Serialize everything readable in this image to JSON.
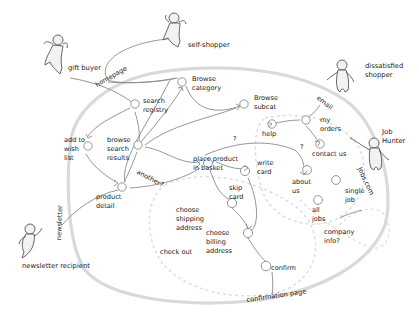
{
  "diagram": {
    "type": "user-journey site map (hand-drawn)",
    "personas": [
      {
        "id": "gift-buyer",
        "label": "gift buyer"
      },
      {
        "id": "self-shopper",
        "label": "self-shopper"
      },
      {
        "id": "dissatisfied-shopper",
        "label": "dissatisfied\nshopper"
      },
      {
        "id": "job-hunter",
        "label": "Job\nHunter"
      },
      {
        "id": "newsletter-recipient",
        "label": "newsletter recipient"
      }
    ],
    "entry_points": {
      "homepage": "homepage",
      "email": "email",
      "jobs_com": "Jobs.com",
      "newsletter": "newsletter",
      "confirmation_page": "confirmation page"
    },
    "nodes": {
      "browse_category": "Browse\ncategory",
      "search_registry": "search\nregistry",
      "browse_subcat": "Browse\nsubcat",
      "add_to_wish_list": "add to\nwish\nlist",
      "browse_search_results": "browse\nsearch\nresults",
      "product_detail": "product\ndetail",
      "place_product_in_basket": "place product\nin basket",
      "write_card": "write\ncard",
      "skip_card": "skip\ncard",
      "choose_shipping_address": "choose\nshipping\naddress",
      "choose_billing_address": "choose\nbilling\naddress",
      "confirm": "confirm",
      "check_out": "check out",
      "help": "help",
      "my_orders": "my\norders",
      "contact_us": "contact us",
      "about_us": "about\nus",
      "single_job": "single\njob",
      "all_jobs": "all\njobs",
      "company_info": "company\ninfo?"
    },
    "annotations": {
      "another": "another?",
      "question_1": "?",
      "question_2": "?"
    }
  }
}
